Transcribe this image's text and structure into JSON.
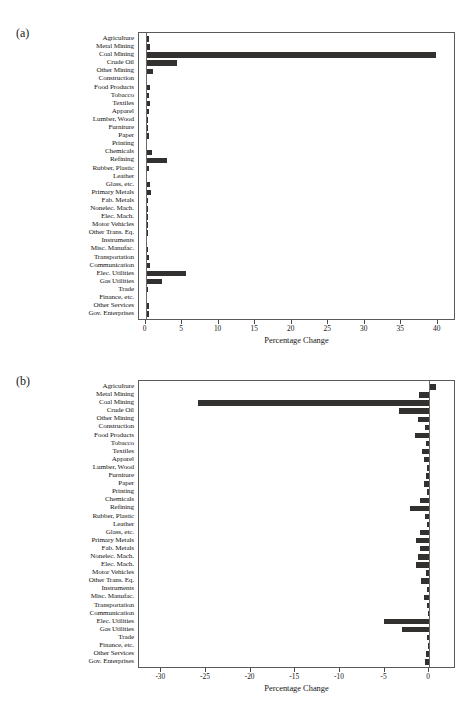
{
  "figure": {
    "panel_a_tag": "(a)",
    "panel_b_tag": "(b)"
  },
  "chart_data": [
    {
      "type": "bar",
      "orientation": "horizontal",
      "panel": "(a)",
      "title": "",
      "xlabel": "Percentage Change",
      "ylabel": "",
      "xlim": [
        -0.9,
        42.5
      ],
      "xticks": [
        0,
        5,
        10,
        15,
        20,
        25,
        30,
        35,
        40
      ],
      "xticklabels": [
        "0",
        "5",
        "10",
        "15",
        "20",
        "25",
        "30",
        "35",
        "40"
      ],
      "grid": false,
      "legend": "none",
      "bar_color": "#33312f",
      "categories": [
        "Agriculture",
        "Metal Mining",
        "Coal Mining",
        "Crude Oil",
        "Other Mining",
        "Construction",
        "Food Products",
        "Tobacco",
        "Textiles",
        "Apparel",
        "Lumber, Wood",
        "Furniture",
        "Paper",
        "Printing",
        "Chemicals",
        "Refining",
        "Rubber, Plastic",
        "Leather",
        "Glass, etc.",
        "Primary Metals",
        "Fab. Metals",
        "Nonelec. Mach.",
        "Elec. Mach.",
        "Motor Vehicles",
        "Other Trans. Eq.",
        "Instruments",
        "Misc. Manufac.",
        "Transportation",
        "Communication",
        "Elec. Utilities",
        "Gas Utilities",
        "Trade",
        "Finance, etc.",
        "Other Services",
        "Gov. Enterprises"
      ],
      "values": [
        0.45,
        0.6,
        39.7,
        4.3,
        1.0,
        0.25,
        0.6,
        0.5,
        0.55,
        0.5,
        0.3,
        0.3,
        0.5,
        0.25,
        0.85,
        2.9,
        0.45,
        0.15,
        0.6,
        0.75,
        0.35,
        0.3,
        0.35,
        0.3,
        0.3,
        0.25,
        0.3,
        0.5,
        0.55,
        5.6,
        2.3,
        0.3,
        0.15,
        0.45,
        0.5
      ]
    },
    {
      "type": "bar",
      "orientation": "horizontal",
      "panel": "(b)",
      "title": "",
      "xlabel": "Percentage Change",
      "ylabel": "",
      "xlim": [
        -32.5,
        3.0
      ],
      "xticks": [
        -30,
        -25,
        -20,
        -15,
        -10,
        -5,
        0
      ],
      "xticklabels": [
        "-30",
        "-25",
        "-20",
        "-15",
        "-10",
        "-5",
        "0"
      ],
      "grid": false,
      "legend": "none",
      "bar_color": "#33312f",
      "categories": [
        "Agriculture",
        "Metal Mining",
        "Coal Mining",
        "Crude Oil",
        "Other Mining",
        "Construction",
        "Food Products",
        "Tobacco",
        "Textiles",
        "Apparel",
        "Lumber, Wood",
        "Furniture",
        "Paper",
        "Printing",
        "Chemicals",
        "Refining",
        "Rubber, Plastic",
        "Leather",
        "Glass, etc.",
        "Primary Metals",
        "Fab. Metals",
        "Nonelec. Mach.",
        "Elec. Mach.",
        "Motor Vehicles",
        "Other Trans. Eq.",
        "Instruments",
        "Misc. Manufac.",
        "Transportation",
        "Communication",
        "Elec. Utilities",
        "Gas Utilities",
        "Trade",
        "Finance, etc.",
        "Other Services",
        "Gov. Enterprises"
      ],
      "values": [
        0.75,
        -1.1,
        -25.9,
        -3.4,
        -1.2,
        -0.45,
        -1.6,
        -0.35,
        -0.8,
        -0.55,
        -0.2,
        -0.4,
        -0.55,
        -0.25,
        -1.0,
        -2.1,
        -0.45,
        -0.2,
        -1.0,
        -1.5,
        -1.05,
        -1.2,
        -1.5,
        -0.35,
        -0.9,
        -0.3,
        -0.6,
        -0.25,
        -0.15,
        -5.1,
        -3.0,
        -0.3,
        -0.15,
        -0.35,
        -0.45
      ]
    }
  ]
}
